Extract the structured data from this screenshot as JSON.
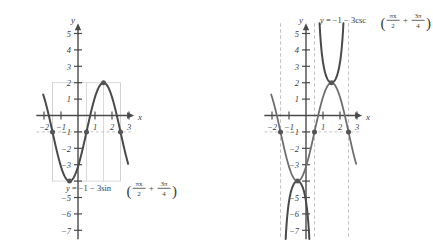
{
  "figure": {
    "panels": [
      {
        "id": "left",
        "equation_label": {
          "lhs": "y",
          "eq": "=",
          "body": "−1 − 3sin",
          "func": "sin",
          "arg_num_1": "πx",
          "arg_den_1": "2",
          "plus": "+",
          "arg_num_2": "3π",
          "arg_den_2": "4",
          "plain": "y = −1 − 3sin(πx/2 + 3π/4)"
        },
        "axis": {
          "x_label": "x",
          "y_label": "y",
          "x_ticks": [
            {
              "value": -2,
              "label": "−2"
            },
            {
              "value": -1,
              "label": "−1"
            },
            {
              "value": 1,
              "label": "1"
            },
            {
              "value": 2,
              "label": "2"
            },
            {
              "value": 3,
              "label": "3"
            }
          ],
          "y_ticks": [
            {
              "value": 5,
              "label": "5"
            },
            {
              "value": 4,
              "label": "4"
            },
            {
              "value": 3,
              "label": "3"
            },
            {
              "value": 2,
              "label": "2"
            },
            {
              "value": 1,
              "label": "1"
            },
            {
              "value": -1,
              "label": "−1"
            },
            {
              "value": -2,
              "label": "−2"
            },
            {
              "value": -3,
              "label": "−3"
            },
            {
              "value": -4,
              "label": ""
            },
            {
              "value": -5,
              "label": "−5"
            },
            {
              "value": -6,
              "label": "−6"
            },
            {
              "value": -7,
              "label": "−7"
            }
          ]
        }
      },
      {
        "id": "right",
        "equation_label": {
          "lhs": "y",
          "eq": "=",
          "body": "−1 − 3csc",
          "func": "csc",
          "arg_num_1": "πx",
          "arg_den_1": "2",
          "plus": "+",
          "arg_num_2": "3π",
          "arg_den_2": "4",
          "plain": "y = −1 − 3csc(πx/2 + 3π/4)"
        },
        "axis": {
          "x_label": "x",
          "y_label": "y",
          "x_ticks": [
            {
              "value": -2,
              "label": "−2"
            },
            {
              "value": -1,
              "label": "−1"
            },
            {
              "value": 1,
              "label": "1"
            },
            {
              "value": 2,
              "label": "2"
            },
            {
              "value": 3,
              "label": "3"
            }
          ],
          "y_ticks": [
            {
              "value": 5,
              "label": "5"
            },
            {
              "value": 4,
              "label": "4"
            },
            {
              "value": 3,
              "label": "3"
            },
            {
              "value": 2,
              "label": "2"
            },
            {
              "value": 1,
              "label": "1"
            },
            {
              "value": -1,
              "label": "−1"
            },
            {
              "value": -2,
              "label": "−2"
            },
            {
              "value": -3,
              "label": "−3"
            },
            {
              "value": -4,
              "label": ""
            },
            {
              "value": -5,
              "label": "−5"
            },
            {
              "value": -6,
              "label": "−6"
            },
            {
              "value": -7,
              "label": "−7"
            }
          ]
        }
      }
    ]
  },
  "chart_data": [
    {
      "id": "sine-plot",
      "type": "line",
      "title": "y = −1 − 3sin(πx/2 + 3π/4)",
      "xlabel": "x",
      "ylabel": "y",
      "xlim": [
        -2.45,
        3.35
      ],
      "ylim": [
        -7.6,
        5.7
      ],
      "grid": false,
      "function": {
        "form": "a + b*sin(c*x + d)",
        "a": -1,
        "b": -3,
        "c": 1.5707963,
        "d": 2.3561945,
        "amplitude": 3,
        "period": 4,
        "phase_shift": -1.5,
        "vertical_shift": -1
      },
      "series": [
        {
          "name": "y = -1 - 3 sin(pi x/2 + 3pi/4)",
          "color": "#4a4a4a",
          "x_start": -2.05,
          "x_end": 2.95,
          "samples": 260
        }
      ],
      "key_points": [
        {
          "x": -1.5,
          "y": -1,
          "kind": "midline-descending"
        },
        {
          "x": -0.5,
          "y": -4,
          "kind": "minimum"
        },
        {
          "x": 0.5,
          "y": -1,
          "kind": "midline-ascending"
        },
        {
          "x": 1.5,
          "y": 2,
          "kind": "maximum"
        },
        {
          "x": 2.5,
          "y": -1,
          "kind": "midline-descending"
        }
      ],
      "midline": {
        "y": -1,
        "style": "dashed",
        "color": "#b9b9b9"
      },
      "guide_box": {
        "x0": -1.5,
        "x1": 2.5,
        "y0": -4,
        "y1": 2,
        "color": "#cfcfcf"
      },
      "guide_verticals": [
        -1.5,
        0.5,
        1.5,
        2.5
      ]
    },
    {
      "id": "cosecant-plot",
      "type": "line",
      "title": "y = −1 − 3csc(πx/2 + 3π/4)",
      "xlabel": "x",
      "ylabel": "y",
      "xlim": [
        -2.45,
        3.35
      ],
      "ylim": [
        -7.6,
        5.7
      ],
      "grid": false,
      "function": {
        "form": "a + b*csc(c*x + d)",
        "a": -1,
        "b": -3,
        "c": 1.5707963,
        "d": 2.3561945,
        "period": 4,
        "vertical_shift": -1
      },
      "asymptotes": [
        {
          "x": -1.5,
          "style": "dashed",
          "color": "#b9b9b9"
        },
        {
          "x": 0.5,
          "style": "dashed",
          "color": "#b9b9b9"
        },
        {
          "x": 2.5,
          "style": "dashed",
          "color": "#b9b9b9"
        }
      ],
      "midline": {
        "y": -1,
        "style": "dashed",
        "color": "#b9b9b9"
      },
      "guide_sine": {
        "name": "y = -1 - 3 sin(pi x/2 + 3pi/4)",
        "color": "#6e6e6e",
        "x_start": -2.05,
        "x_end": 2.95
      },
      "branches": [
        {
          "x_start": -1.5,
          "x_end": 0.5,
          "direction": "down",
          "vertex": {
            "x": -0.5,
            "y": -4
          }
        },
        {
          "x_start": 0.5,
          "x_end": 2.5,
          "direction": "up",
          "vertex": {
            "x": 1.5,
            "y": 2
          }
        }
      ],
      "key_points": [
        {
          "x": -1.5,
          "y": -1,
          "kind": "asymptote-foot"
        },
        {
          "x": -0.5,
          "y": -4,
          "kind": "local-maximum-lower-branch"
        },
        {
          "x": 0.5,
          "y": -1,
          "kind": "asymptote-foot"
        },
        {
          "x": 1.5,
          "y": 2,
          "kind": "local-minimum-upper-branch"
        },
        {
          "x": 2.5,
          "y": -1,
          "kind": "asymptote-foot"
        }
      ]
    }
  ]
}
